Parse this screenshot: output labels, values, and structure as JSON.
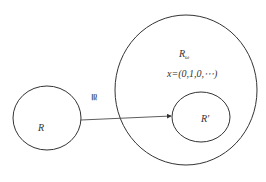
{
  "diagram": {
    "type": "set-mapping",
    "colors": {
      "stroke": "#333333",
      "background": "#ffffff",
      "text": "#333333"
    },
    "nodes": [
      {
        "id": "R",
        "label": "R",
        "shape": "ellipse",
        "cx": 47,
        "cy": 118,
        "rx": 34,
        "ry": 32
      },
      {
        "id": "R_omega",
        "label": "R",
        "subscript": "ω",
        "shape": "ellipse",
        "cx": 186,
        "cy": 90,
        "rx": 71,
        "ry": 75
      },
      {
        "id": "R_prime",
        "label": "R′",
        "shape": "ellipse",
        "cx": 201,
        "cy": 117,
        "rx": 29,
        "ry": 25,
        "parent": "R_omega"
      }
    ],
    "edges": [
      {
        "from": "R",
        "to": "R_prime",
        "label": "≅",
        "label_rotation": 90
      }
    ],
    "annotations": {
      "element": "x=(0,1,0,⋯)"
    }
  },
  "labels": {
    "R": "R",
    "R_omega_base": "R",
    "R_omega_sub": "ω",
    "element": "x=(0,1,0,⋯)",
    "R_prime": "R′",
    "iso": "≅"
  }
}
